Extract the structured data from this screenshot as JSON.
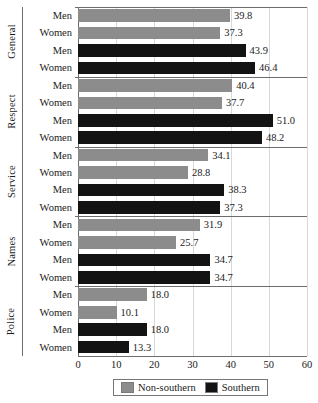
{
  "chart_data": {
    "type": "bar",
    "orientation": "horizontal",
    "title": "",
    "subtitle": "",
    "xlabel": "",
    "ylabel": "",
    "xlim": [
      0,
      60
    ],
    "xticks": [
      0,
      10,
      20,
      30,
      40,
      50,
      60
    ],
    "xtick_labels": [
      "0",
      "10",
      "20",
      "30",
      "40",
      "50",
      "60"
    ],
    "grid": true,
    "grid_axis": "x",
    "legend": {
      "position": "bottom",
      "entries": [
        {
          "name": "Non-southern",
          "color": "#8c8c8c"
        },
        {
          "name": "Southern",
          "color": "#131313"
        }
      ]
    },
    "series": [
      {
        "name": "Non-southern",
        "color": "#8c8c8c"
      },
      {
        "name": "Southern",
        "color": "#131313"
      }
    ],
    "groups": [
      {
        "label": "General",
        "rows": [
          {
            "label": "Men",
            "series": "Non-southern",
            "value": 39.8,
            "value_label": "39.8"
          },
          {
            "label": "Women",
            "series": "Non-southern",
            "value": 37.3,
            "value_label": "37.3"
          },
          {
            "label": "Men",
            "series": "Southern",
            "value": 43.9,
            "value_label": "43.9"
          },
          {
            "label": "Women",
            "series": "Southern",
            "value": 46.4,
            "value_label": "46.4"
          }
        ]
      },
      {
        "label": "Respect",
        "rows": [
          {
            "label": "Men",
            "series": "Non-southern",
            "value": 40.4,
            "value_label": "40.4"
          },
          {
            "label": "Women",
            "series": "Non-southern",
            "value": 37.7,
            "value_label": "37.7"
          },
          {
            "label": "Men",
            "series": "Southern",
            "value": 51.0,
            "value_label": "51.0"
          },
          {
            "label": "Women",
            "series": "Southern",
            "value": 48.2,
            "value_label": "48.2"
          }
        ]
      },
      {
        "label": "Service",
        "rows": [
          {
            "label": "Men",
            "series": "Non-southern",
            "value": 34.1,
            "value_label": "34.1"
          },
          {
            "label": "Women",
            "series": "Non-southern",
            "value": 28.8,
            "value_label": "28.8"
          },
          {
            "label": "Men",
            "series": "Southern",
            "value": 38.3,
            "value_label": "38.3"
          },
          {
            "label": "Women",
            "series": "Southern",
            "value": 37.3,
            "value_label": "37.3"
          }
        ]
      },
      {
        "label": "Names",
        "rows": [
          {
            "label": "Men",
            "series": "Non-southern",
            "value": 31.9,
            "value_label": "31.9"
          },
          {
            "label": "Women",
            "series": "Non-southern",
            "value": 25.7,
            "value_label": "25.7"
          },
          {
            "label": "Men",
            "series": "Southern",
            "value": 34.7,
            "value_label": "34.7"
          },
          {
            "label": "Women",
            "series": "Southern",
            "value": 34.7,
            "value_label": "34.7"
          }
        ]
      },
      {
        "label": "Police",
        "rows": [
          {
            "label": "Men",
            "series": "Non-southern",
            "value": 18.0,
            "value_label": "18.0"
          },
          {
            "label": "Women",
            "series": "Non-southern",
            "value": 10.1,
            "value_label": "10.1"
          },
          {
            "label": "Men",
            "series": "Southern",
            "value": 18.0,
            "value_label": "18.0"
          },
          {
            "label": "Women",
            "series": "Southern",
            "value": 13.3,
            "value_label": "13.3"
          }
        ]
      }
    ]
  }
}
